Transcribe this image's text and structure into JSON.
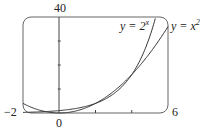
{
  "chart_data": {
    "type": "line",
    "title": "",
    "xlabel": "",
    "ylabel": "",
    "xlim": [
      -2,
      6
    ],
    "ylim": [
      0,
      40
    ],
    "x_tick_labels": {
      "left": "−2",
      "origin": "0",
      "right": "6"
    },
    "y_tick_labels": {
      "top": "40"
    },
    "x_ticks": [
      2,
      4
    ],
    "y_ticks": [
      10,
      20,
      30
    ],
    "grid": false,
    "series": [
      {
        "name": "y = 2^x",
        "label_base": "y = 2",
        "label_exp": "x",
        "function": "2^x",
        "x": [
          -2,
          -1,
          0,
          1,
          2,
          3,
          4,
          5,
          5.32
        ],
        "values": [
          0.25,
          0.5,
          1,
          2,
          4,
          8,
          16,
          32,
          40
        ]
      },
      {
        "name": "y = x^2",
        "label_base": "y = x",
        "label_exp": "2",
        "function": "x^2",
        "x": [
          -2,
          -1,
          0,
          1,
          2,
          3,
          4,
          5,
          6
        ],
        "values": [
          4,
          1,
          0,
          1,
          4,
          9,
          16,
          25,
          36
        ]
      }
    ]
  },
  "colors": {
    "curve": "#333333",
    "frame": "#555555",
    "axis": "#444444"
  }
}
